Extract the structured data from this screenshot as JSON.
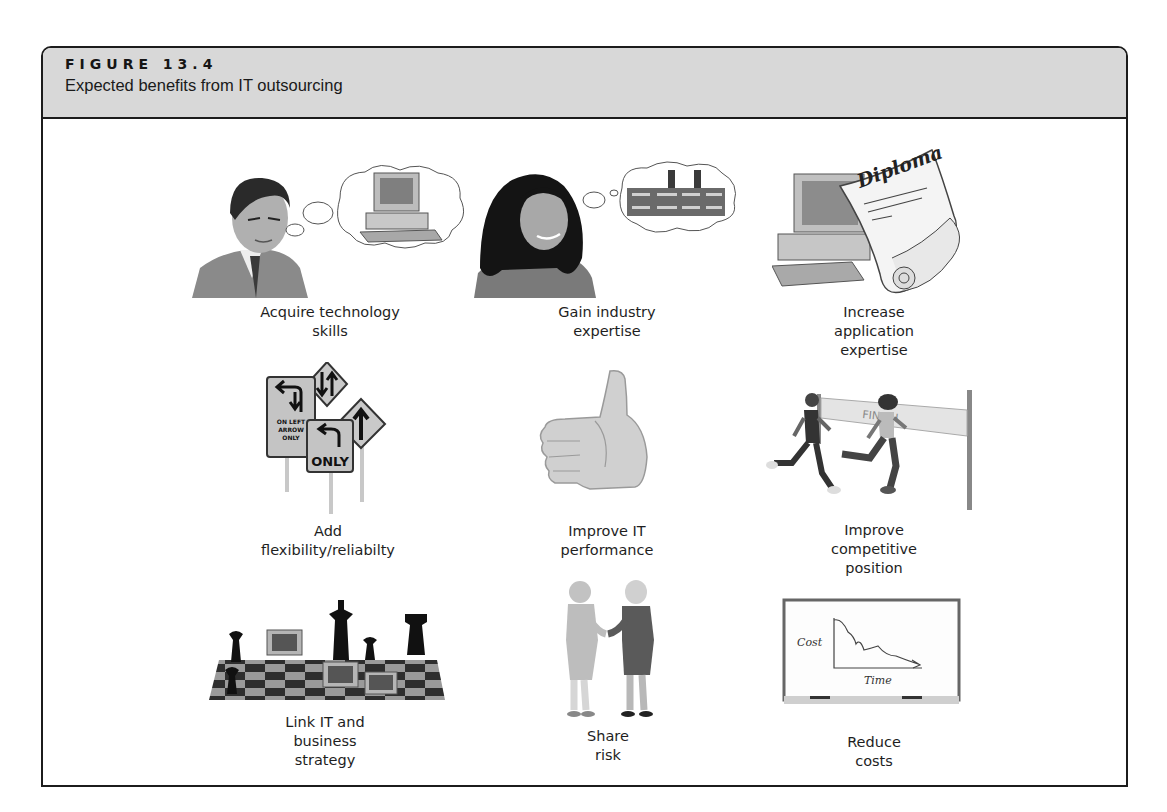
{
  "figure": {
    "label": "FIGURE 13.4",
    "title": "Expected benefits from IT outsourcing"
  },
  "benefits": [
    {
      "caption": "Acquire technology\nskills",
      "illustration": "businessman-thinking-of-computer"
    },
    {
      "caption": "Gain industry\nexpertise",
      "illustration": "woman-thinking-of-factory"
    },
    {
      "caption": "Increase application\nexpertise",
      "illustration": "computer-with-diploma"
    },
    {
      "caption": "Add flexibility/reliabilty",
      "illustration": "traffic-signs"
    },
    {
      "caption": "Improve IT\nperformance",
      "illustration": "thumbs-up"
    },
    {
      "caption": "Improve competitive\nposition",
      "illustration": "runners-at-finish-line"
    },
    {
      "caption": "Link IT and business\nstrategy",
      "illustration": "chessboard-with-computers"
    },
    {
      "caption": "Share risk",
      "illustration": "handshake"
    },
    {
      "caption": "Reduce costs",
      "illustration": "cost-time-whiteboard"
    }
  ],
  "illustration_text": {
    "diploma": "Diploma",
    "sign_left_arrow": "ON LEFT\nARROW\nONLY",
    "sign_only": "ONLY",
    "finish_banner": "FINISH",
    "chart_y_label": "Cost",
    "chart_x_label": "Time"
  },
  "colors": {
    "header_bg": "#d8d8d8",
    "border": "#1c1c1c",
    "text": "#1e1e1e"
  }
}
